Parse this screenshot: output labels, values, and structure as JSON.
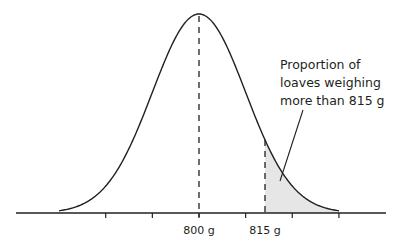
{
  "chart_data": {
    "type": "area",
    "title": "",
    "xlabel": "",
    "ylabel": "",
    "distribution": "normal",
    "mean": 800,
    "sd": 10.6,
    "unit": "g",
    "xlim": [
      772,
      842
    ],
    "tick_values": [
      778.8,
      789.4,
      800,
      810.6,
      821.2,
      831.8
    ],
    "tick_labels": [
      {
        "value": 800,
        "text": "800 g"
      },
      {
        "value": 815,
        "text": "815 g"
      }
    ],
    "mean_line": {
      "value": 800,
      "style": "dashed"
    },
    "threshold_line": {
      "value": 815,
      "style": "dashed"
    },
    "shaded_region": {
      "from": 815,
      "to": 842,
      "color": "#e6e6e6"
    },
    "annotation": {
      "lines": [
        "Proportion of",
        "loaves weighing",
        "more than 815 g"
      ],
      "points_to": "shaded-region"
    },
    "grid": false,
    "legend": "none",
    "colors": {
      "curve": "#231f20",
      "shade": "#e6e6e6",
      "text": "#231f20"
    }
  }
}
